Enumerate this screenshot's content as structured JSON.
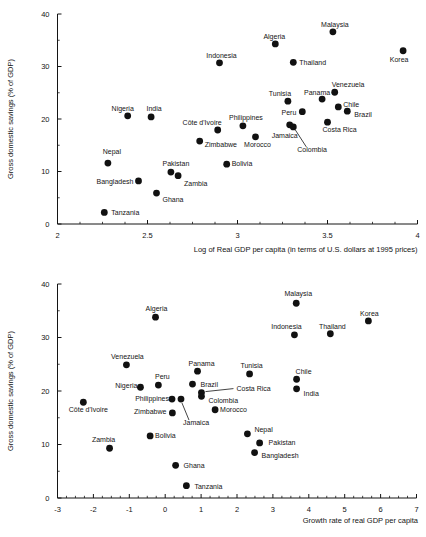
{
  "figure": {
    "background": "#ffffff",
    "ink_color": "#141414",
    "point_color": "#111111"
  },
  "chart_data": [
    {
      "id": "top",
      "type": "scatter",
      "title": "",
      "xlabel": "Log of Real GDP per capita (in terms of U.S. dollars at 1995 prices)",
      "ylabel": "Gross domestic savings (% of GDP)",
      "xlim": [
        2,
        4
      ],
      "ylim": [
        0,
        40
      ],
      "x_tick_labels": [
        "2",
        "2.5",
        "3",
        "3.5",
        "4"
      ],
      "x_ticks": [
        2,
        2.5,
        3,
        3.5,
        4
      ],
      "x_minor_step": 0.125,
      "y_tick_labels": [
        "0",
        "10",
        "20",
        "30",
        "40"
      ],
      "y_ticks": [
        0,
        10,
        20,
        30,
        40
      ],
      "y_minor_step": 5,
      "grid": false,
      "legend": "none",
      "points": [
        {
          "name": "Malaysia",
          "x": 3.53,
          "y": 36.6,
          "anchor": "middle",
          "dx": 2,
          "dy": -5
        },
        {
          "name": "Algeria",
          "x": 3.21,
          "y": 34.3,
          "anchor": "middle",
          "dx": -1,
          "dy": -5
        },
        {
          "name": "Korea",
          "x": 3.92,
          "y": 33.0,
          "anchor": "middle",
          "dx": -4,
          "dy": 11
        },
        {
          "name": "Thailand",
          "x": 3.31,
          "y": 30.8,
          "anchor": "start",
          "dx": 6,
          "dy": 3
        },
        {
          "name": "Indonesia",
          "x": 2.9,
          "y": 30.7,
          "anchor": "middle",
          "dx": 2,
          "dy": -5
        },
        {
          "name": "Venezuela",
          "x": 3.54,
          "y": 25.1,
          "anchor": "start",
          "dx": -3,
          "dy": -5
        },
        {
          "name": "Panama",
          "x": 3.47,
          "y": 23.8,
          "anchor": "middle",
          "dx": -5,
          "dy": -4
        },
        {
          "name": "Tunisia",
          "x": 3.28,
          "y": 23.4,
          "anchor": "middle",
          "dx": -8,
          "dy": -5
        },
        {
          "name": "Chile",
          "x": 3.56,
          "y": 22.3,
          "anchor": "start",
          "dx": 5,
          "dy": 0
        },
        {
          "name": "Brazil",
          "x": 3.61,
          "y": 21.5,
          "anchor": "start",
          "dx": 7,
          "dy": 6
        },
        {
          "name": "Peru",
          "x": 3.36,
          "y": 21.4,
          "anchor": "end",
          "dx": -6,
          "dy": 3
        },
        {
          "name": "Nigeria",
          "x": 2.39,
          "y": 20.6,
          "anchor": "middle",
          "dx": -5,
          "dy": -5
        },
        {
          "name": "India",
          "x": 2.52,
          "y": 20.4,
          "anchor": "middle",
          "dx": 3,
          "dy": -6
        },
        {
          "name": "Costa Rica",
          "x": 3.5,
          "y": 19.4,
          "anchor": "start",
          "dx": -5,
          "dy": 10
        },
        {
          "name": "Philippines",
          "x": 3.03,
          "y": 18.7,
          "anchor": "middle",
          "dx": 3,
          "dy": -6
        },
        {
          "name": "Jamaica",
          "x": 3.29,
          "y": 18.9,
          "anchor": "middle",
          "dx": -5,
          "dy": 13
        },
        {
          "name": "Colombia",
          "x": 3.31,
          "y": 18.5,
          "anchor": "start",
          "dx": 4,
          "dy": 25,
          "leader": [
            2,
            3,
            13,
            20
          ]
        },
        {
          "name": "Côte d'Ivoire",
          "x": 2.89,
          "y": 17.9,
          "anchor": "end",
          "dx": 4,
          "dy": -5
        },
        {
          "name": "Morocco",
          "x": 3.1,
          "y": 16.6,
          "anchor": "middle",
          "dx": 2,
          "dy": 10
        },
        {
          "name": "Zimbabwe",
          "x": 2.79,
          "y": 15.8,
          "anchor": "start",
          "dx": 5,
          "dy": 6
        },
        {
          "name": "Nepal",
          "x": 2.28,
          "y": 11.6,
          "anchor": "middle",
          "dx": 4,
          "dy": -9
        },
        {
          "name": "Bolivia",
          "x": 2.94,
          "y": 11.4,
          "anchor": "start",
          "dx": 5,
          "dy": 2
        },
        {
          "name": "Pakistan",
          "x": 2.63,
          "y": 9.9,
          "anchor": "middle",
          "dx": 5,
          "dy": -6
        },
        {
          "name": "Zambia",
          "x": 2.67,
          "y": 9.2,
          "anchor": "start",
          "dx": 6,
          "dy": 10
        },
        {
          "name": "Bangladesh",
          "x": 2.45,
          "y": 8.2,
          "anchor": "end",
          "dx": -5,
          "dy": 3
        },
        {
          "name": "Ghana",
          "x": 2.55,
          "y": 5.9,
          "anchor": "start",
          "dx": 6,
          "dy": 9
        },
        {
          "name": "Tanzania",
          "x": 2.26,
          "y": 2.2,
          "anchor": "start",
          "dx": 7,
          "dy": 3
        }
      ]
    },
    {
      "id": "bottom",
      "type": "scatter",
      "title": "",
      "xlabel": "Growth rate of real GDP per capita",
      "ylabel": "Gross domestic savings (% of GDP)",
      "xlim": [
        -3,
        7
      ],
      "ylim": [
        0,
        40
      ],
      "x_tick_labels": [
        "-3",
        "-2",
        "-1",
        "0",
        "1",
        "2",
        "3",
        "4",
        "5",
        "6",
        "7"
      ],
      "x_ticks": [
        -3,
        -2,
        -1,
        0,
        1,
        2,
        3,
        4,
        5,
        6,
        7
      ],
      "x_minor_step": 0.25,
      "y_tick_labels": [
        "0",
        "10",
        "20",
        "30",
        "40"
      ],
      "y_ticks": [
        0,
        10,
        20,
        30,
        40
      ],
      "y_minor_step": 5,
      "grid": false,
      "legend": "none",
      "points": [
        {
          "name": "Malaysia",
          "x": 3.65,
          "y": 36.4,
          "anchor": "middle",
          "dx": 2,
          "dy": -7
        },
        {
          "name": "Korea",
          "x": 5.66,
          "y": 33.1,
          "anchor": "middle",
          "dx": 1,
          "dy": -5
        },
        {
          "name": "Algeria",
          "x": -0.27,
          "y": 33.8,
          "anchor": "middle",
          "dx": 1,
          "dy": -6
        },
        {
          "name": "Indonesia",
          "x": 3.6,
          "y": 30.5,
          "anchor": "middle",
          "dx": -8,
          "dy": -6
        },
        {
          "name": "Thailand",
          "x": 4.6,
          "y": 30.7,
          "anchor": "middle",
          "dx": 2,
          "dy": -5
        },
        {
          "name": "Venezuela",
          "x": -1.08,
          "y": 24.9,
          "anchor": "middle",
          "dx": 1,
          "dy": -6
        },
        {
          "name": "Panama",
          "x": 0.9,
          "y": 23.7,
          "anchor": "middle",
          "dx": 4,
          "dy": -5
        },
        {
          "name": "Tunisia",
          "x": 2.35,
          "y": 23.2,
          "anchor": "middle",
          "dx": 2,
          "dy": -6
        },
        {
          "name": "Chile",
          "x": 3.66,
          "y": 22.2,
          "anchor": "start",
          "dx": -1,
          "dy": -5
        },
        {
          "name": "Peru",
          "x": -0.19,
          "y": 21.1,
          "anchor": "middle",
          "dx": 4,
          "dy": -6
        },
        {
          "name": "Brazil",
          "x": 0.76,
          "y": 21.3,
          "anchor": "start",
          "dx": 8,
          "dy": 3
        },
        {
          "name": "Nigeria",
          "x": -0.69,
          "y": 20.7,
          "anchor": "end",
          "dx": -3,
          "dy": 1
        },
        {
          "name": "India",
          "x": 3.66,
          "y": 20.4,
          "anchor": "start",
          "dx": 7,
          "dy": 7
        },
        {
          "name": "Costa Rica",
          "x": 1.01,
          "y": 19.7,
          "anchor": "start",
          "dx": 35,
          "dy": -2,
          "leader": [
            4,
            -1,
            32,
            -4
          ]
        },
        {
          "name": "Colombia",
          "x": 1.01,
          "y": 19.0,
          "anchor": "start",
          "dx": 7,
          "dy": 7
        },
        {
          "name": "Philippines",
          "x": 0.19,
          "y": 18.5,
          "anchor": "end",
          "dx": -3,
          "dy": 2
        },
        {
          "name": "Jamaica",
          "x": 0.44,
          "y": 18.5,
          "anchor": "start",
          "dx": 2,
          "dy": 26,
          "leader": [
            1,
            4,
            8,
            21
          ]
        },
        {
          "name": "Côte d'Ivoire",
          "x": -2.28,
          "y": 17.9,
          "anchor": "middle",
          "dx": 5,
          "dy": 10
        },
        {
          "name": "Zimbabwe",
          "x": 0.2,
          "y": 15.9,
          "anchor": "end",
          "dx": -6,
          "dy": 1
        },
        {
          "name": "Morocco",
          "x": 1.39,
          "y": 16.5,
          "anchor": "start",
          "dx": 5,
          "dy": 2
        },
        {
          "name": "Nepal",
          "x": 2.29,
          "y": 12.0,
          "anchor": "start",
          "dx": 7,
          "dy": -2
        },
        {
          "name": "Bolivia",
          "x": -0.42,
          "y": 11.6,
          "anchor": "start",
          "dx": 5,
          "dy": 2
        },
        {
          "name": "Pakistan",
          "x": 2.63,
          "y": 10.3,
          "anchor": "start",
          "dx": 9,
          "dy": 2
        },
        {
          "name": "Zambia",
          "x": -1.55,
          "y": 9.3,
          "anchor": "middle",
          "dx": -6,
          "dy": -6
        },
        {
          "name": "Bangladesh",
          "x": 2.49,
          "y": 8.5,
          "anchor": "start",
          "dx": 7,
          "dy": 5
        },
        {
          "name": "Ghana",
          "x": 0.29,
          "y": 6.1,
          "anchor": "start",
          "dx": 8,
          "dy": 3
        },
        {
          "name": "Tanzania",
          "x": 0.59,
          "y": 2.3,
          "anchor": "start",
          "dx": 8,
          "dy": 3
        }
      ]
    }
  ]
}
